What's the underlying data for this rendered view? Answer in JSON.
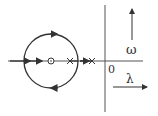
{
  "diagram": {
    "type": "root-locus",
    "origin_label": "0",
    "vertical_axis_label": "ω",
    "horizontal_axis_label": "λ",
    "zero_marker": "⊙",
    "pole_markers": [
      "×",
      "×"
    ],
    "stroke_color": "#333333",
    "background": "#ffffff"
  }
}
